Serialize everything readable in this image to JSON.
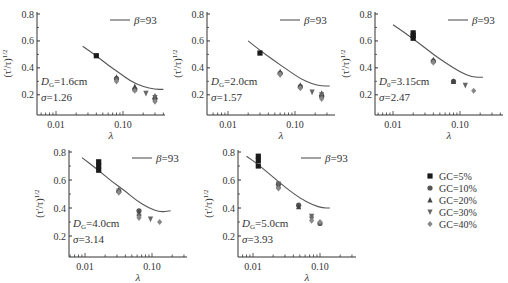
{
  "chart_data": [
    {
      "type": "scatter",
      "panel": 1,
      "annotation": {
        "D": "D",
        "D_sub": "G",
        "D_value": "=1.6cm",
        "sigma": "σ",
        "sigma_value": "=1.26"
      },
      "xlabel": "λ",
      "ylabel": "(τ'/τ)^1/2",
      "xscale": "log",
      "xticks": [
        "0.01",
        "0.10"
      ],
      "yticks": [
        "0.2",
        "0.4",
        "0.6",
        "0.8"
      ],
      "ylim": [
        0.05,
        0.8
      ],
      "legend_line": "β=93",
      "curve": {
        "x": [
          0.025,
          0.04,
          0.06,
          0.09,
          0.13,
          0.2,
          0.3,
          0.4
        ],
        "y": [
          0.56,
          0.49,
          0.42,
          0.36,
          0.3,
          0.26,
          0.24,
          0.24
        ]
      },
      "series": [
        {
          "name": "GC=5%",
          "points": [
            [
              0.04,
              0.49
            ]
          ]
        },
        {
          "name": "GC=10%",
          "points": [
            [
              0.08,
              0.32
            ],
            [
              0.15,
              0.24
            ],
            [
              0.3,
              0.17
            ]
          ]
        },
        {
          "name": "GC=20%",
          "points": [
            [
              0.08,
              0.33
            ],
            [
              0.15,
              0.26
            ],
            [
              0.3,
              0.19
            ]
          ]
        },
        {
          "name": "GC=30%",
          "points": [
            [
              0.08,
              0.31
            ],
            [
              0.22,
              0.21
            ],
            [
              0.3,
              0.18
            ]
          ]
        },
        {
          "name": "GC=40%",
          "points": [
            [
              0.08,
              0.3
            ],
            [
              0.15,
              0.23
            ],
            [
              0.3,
              0.15
            ]
          ]
        }
      ]
    },
    {
      "type": "scatter",
      "panel": 2,
      "annotation": {
        "D": "D",
        "D_sub": "G",
        "D_value": "=2.0cm",
        "sigma": "σ",
        "sigma_value": "=1.57"
      },
      "xlabel": "λ",
      "ylabel": "(τ'/τ)^1/2",
      "xscale": "log",
      "xticks": [
        "0.01",
        "0.10"
      ],
      "yticks": [
        "0.2",
        "0.4",
        "0.6",
        "0.8"
      ],
      "ylim": [
        0.05,
        0.8
      ],
      "legend_line": "β=93",
      "curve": {
        "x": [
          0.02,
          0.03,
          0.05,
          0.08,
          0.12,
          0.18,
          0.25,
          0.33
        ],
        "y": [
          0.6,
          0.53,
          0.45,
          0.38,
          0.32,
          0.28,
          0.265,
          0.265
        ]
      },
      "series": [
        {
          "name": "GC=5%",
          "points": [
            [
              0.03,
              0.51
            ]
          ]
        },
        {
          "name": "GC=10%",
          "points": [
            [
              0.06,
              0.36
            ],
            [
              0.12,
              0.26
            ],
            [
              0.25,
              0.19
            ]
          ]
        },
        {
          "name": "GC=20%",
          "points": [
            [
              0.06,
              0.37
            ],
            [
              0.12,
              0.27
            ],
            [
              0.25,
              0.21
            ]
          ]
        },
        {
          "name": "GC=30%",
          "points": [
            [
              0.06,
              0.35
            ],
            [
              0.18,
              0.22
            ],
            [
              0.25,
              0.2
            ]
          ]
        },
        {
          "name": "GC=40%",
          "points": [
            [
              0.06,
              0.35
            ],
            [
              0.12,
              0.25
            ],
            [
              0.25,
              0.17
            ]
          ]
        }
      ]
    },
    {
      "type": "scatter",
      "panel": 3,
      "annotation": {
        "D": "D",
        "D_sub": "0",
        "D_value": "=3.15cm",
        "sigma": "σ",
        "sigma_value": "=2.47"
      },
      "xlabel": "λ",
      "ylabel": "(τ'/τ)^1/2",
      "xscale": "log",
      "xticks": [
        "0.01",
        "0.10"
      ],
      "yticks": [
        "0.2",
        "0.4",
        "0.6",
        "0.8"
      ],
      "ylim": [
        0.05,
        0.8
      ],
      "legend_line": "β=93",
      "curve": {
        "x": [
          0.01,
          0.015,
          0.025,
          0.04,
          0.06,
          0.1,
          0.15,
          0.22
        ],
        "y": [
          0.72,
          0.66,
          0.58,
          0.5,
          0.44,
          0.37,
          0.33,
          0.33
        ]
      },
      "series": [
        {
          "name": "GC=5%",
          "points": [
            [
              0.02,
              0.62
            ],
            [
              0.02,
              0.64
            ],
            [
              0.02,
              0.66
            ]
          ]
        },
        {
          "name": "GC=10%",
          "points": [
            [
              0.04,
              0.45
            ],
            [
              0.08,
              0.3
            ]
          ]
        },
        {
          "name": "GC=20%",
          "points": [
            [
              0.04,
              0.46
            ],
            [
              0.08,
              0.3
            ]
          ]
        },
        {
          "name": "GC=30%",
          "points": [
            [
              0.04,
              0.44
            ],
            [
              0.12,
              0.27
            ]
          ]
        },
        {
          "name": "GC=40%",
          "points": [
            [
              0.04,
              0.44
            ],
            [
              0.16,
              0.23
            ]
          ]
        }
      ]
    },
    {
      "type": "scatter",
      "panel": 4,
      "annotation": {
        "D": "D",
        "D_sub": "G",
        "D_value": "=4.0cm",
        "sigma": "σ",
        "sigma_value": "=3.14"
      },
      "xlabel": "λ",
      "ylabel": "(τ'/τ)^1/2",
      "xscale": "log",
      "xticks": [
        "0.01",
        "0.10"
      ],
      "yticks": [
        "0.2",
        "0.4",
        "0.6",
        "0.8"
      ],
      "ylim": [
        0.05,
        0.8
      ],
      "legend_line": "β=93",
      "curve": {
        "x": [
          0.009,
          0.015,
          0.025,
          0.04,
          0.06,
          0.09,
          0.13,
          0.19
        ],
        "y": [
          0.76,
          0.68,
          0.59,
          0.52,
          0.45,
          0.4,
          0.37,
          0.38
        ]
      },
      "series": [
        {
          "name": "GC=5%",
          "points": [
            [
              0.016,
              0.67
            ],
            [
              0.016,
              0.7
            ],
            [
              0.016,
              0.73
            ]
          ]
        },
        {
          "name": "GC=10%",
          "points": [
            [
              0.032,
              0.52
            ],
            [
              0.064,
              0.38
            ]
          ]
        },
        {
          "name": "GC=20%",
          "points": [
            [
              0.032,
              0.53
            ],
            [
              0.064,
              0.36
            ]
          ]
        },
        {
          "name": "GC=30%",
          "points": [
            [
              0.032,
              0.52
            ],
            [
              0.064,
              0.34
            ],
            [
              0.095,
              0.32
            ]
          ]
        },
        {
          "name": "GC=40%",
          "points": [
            [
              0.032,
              0.51
            ],
            [
              0.064,
              0.33
            ],
            [
              0.13,
              0.3
            ]
          ]
        }
      ]
    },
    {
      "type": "scatter",
      "panel": 5,
      "annotation": {
        "D": "D",
        "D_sub": "G",
        "D_value": "=5.0cm",
        "sigma": "σ",
        "sigma_value": "=3.93"
      },
      "xlabel": "λ",
      "ylabel": "(τ'/τ)^1/2",
      "xscale": "log",
      "xticks": [
        "0.01",
        "0.10"
      ],
      "yticks": [
        "0.2",
        "0.4",
        "0.6",
        "0.8"
      ],
      "ylim": [
        0.05,
        0.8
      ],
      "legend_line": "β=93",
      "curve": {
        "x": [
          0.008,
          0.012,
          0.02,
          0.03,
          0.05,
          0.08,
          0.11,
          0.14
        ],
        "y": [
          0.77,
          0.71,
          0.62,
          0.55,
          0.47,
          0.42,
          0.4,
          0.4
        ]
      },
      "series": [
        {
          "name": "GC=5%",
          "points": [
            [
              0.012,
              0.7
            ],
            [
              0.012,
              0.74
            ],
            [
              0.012,
              0.77
            ]
          ]
        },
        {
          "name": "GC=10%",
          "points": [
            [
              0.024,
              0.57
            ],
            [
              0.048,
              0.42
            ],
            [
              0.1,
              0.29
            ]
          ]
        },
        {
          "name": "GC=20%",
          "points": [
            [
              0.024,
              0.56
            ],
            [
              0.048,
              0.41
            ]
          ]
        },
        {
          "name": "GC=30%",
          "points": [
            [
              0.024,
              0.57
            ],
            [
              0.075,
              0.34
            ],
            [
              0.075,
              0.32
            ]
          ]
        },
        {
          "name": "GC=40%",
          "points": [
            [
              0.024,
              0.54
            ],
            [
              0.075,
              0.31
            ],
            [
              0.1,
              0.3
            ]
          ]
        }
      ]
    }
  ],
  "legend": {
    "items": [
      {
        "label": "GC=5%",
        "marker": "square",
        "color": "#1a1a1a"
      },
      {
        "label": "GC=10%",
        "marker": "circle",
        "color": "#555555"
      },
      {
        "label": "GC=20%",
        "marker": "triangle-up",
        "color": "#444444"
      },
      {
        "label": "GC=30%",
        "marker": "triangle-down",
        "color": "#666666"
      },
      {
        "label": "GC=40%",
        "marker": "diamond",
        "color": "#888888"
      }
    ]
  },
  "layout": {
    "panels": [
      {
        "x0": 37,
        "y0": 12,
        "w": 128,
        "h": 103,
        "dec0x": 56
      },
      {
        "x0": 207,
        "y0": 12,
        "w": 128,
        "h": 103,
        "dec0x": 228
      },
      {
        "x0": 375,
        "y0": 12,
        "w": 128,
        "h": 103,
        "dec0x": 393
      },
      {
        "x0": 69,
        "y0": 150,
        "w": 118,
        "h": 107,
        "dec0x": 85
      },
      {
        "x0": 238,
        "y0": 150,
        "w": 118,
        "h": 107,
        "dec0x": 253
      }
    ],
    "decade_px": 67,
    "ylabel_text": "(τ'/τ)",
    "ylabel_sup": "1/2"
  }
}
